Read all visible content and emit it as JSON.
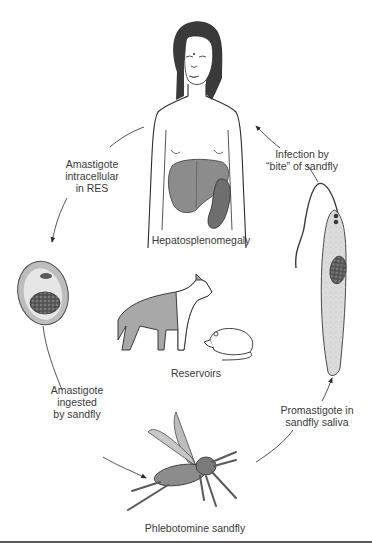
{
  "diagram": {
    "type": "life-cycle",
    "colors": {
      "line": "#2b2b2b",
      "organ_fill": "#8c8c8c",
      "spleen_fill": "#6e6e6e",
      "cell_fill": "#d9d9d9",
      "nucleus_fill": "#555555",
      "text": "#3a3a3a"
    },
    "stages": [
      {
        "id": "human",
        "label": "Hepatosplenomegaly"
      },
      {
        "id": "amastigote-cell",
        "label": ""
      },
      {
        "id": "reservoirs",
        "label": "Reservoirs"
      },
      {
        "id": "sandfly",
        "label": "Phlebotomine sandfly"
      },
      {
        "id": "promastigote",
        "label": ""
      }
    ],
    "transitions": [
      {
        "from": "human",
        "to": "amastigote-cell",
        "label": "Amastigote\nintracellular\nin RES"
      },
      {
        "from": "amastigote-cell",
        "to": "sandfly",
        "label": "Amastigote\ningested\nby sandfly"
      },
      {
        "from": "sandfly",
        "to": "promastigote",
        "label": "Promastigote in\nsandfly saliva"
      },
      {
        "from": "promastigote",
        "to": "human",
        "label": "Infection by\n“bite” of sandfly"
      }
    ]
  }
}
